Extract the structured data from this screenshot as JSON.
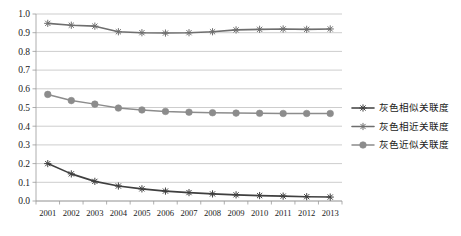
{
  "chart_data": {
    "type": "line",
    "title": "",
    "xlabel": "",
    "ylabel": "",
    "categories": [
      "2001",
      "2002",
      "2003",
      "2004",
      "2005",
      "2006",
      "2007",
      "2008",
      "2009",
      "2010",
      "2011",
      "2012",
      "2013"
    ],
    "ylim": [
      0.0,
      1.0
    ],
    "ytick_labels": [
      "0.0",
      "0.1",
      "0.2",
      "0.3",
      "0.4",
      "0.5",
      "0.6",
      "0.7",
      "0.8",
      "0.9",
      "1.0"
    ],
    "ytick_values": [
      0.0,
      0.1,
      0.2,
      0.3,
      0.4,
      0.5,
      0.6,
      0.7,
      0.8,
      0.9,
      1.0
    ],
    "grid": "horizontal",
    "legend_position": "right",
    "series": [
      {
        "name": "灰色相似关联度",
        "marker": "star",
        "color": "#3f3f3f",
        "values": [
          0.2,
          0.145,
          0.105,
          0.08,
          0.065,
          0.053,
          0.045,
          0.038,
          0.033,
          0.029,
          0.026,
          0.023,
          0.021
        ]
      },
      {
        "name": "灰色相近关联度",
        "marker": "star",
        "color": "#6e6e6e",
        "values": [
          0.95,
          0.94,
          0.935,
          0.905,
          0.9,
          0.898,
          0.9,
          0.905,
          0.915,
          0.918,
          0.92,
          0.918,
          0.92
        ]
      },
      {
        "name": "灰色近似关联度",
        "marker": "circle",
        "color": "#8c8c8c",
        "values": [
          0.57,
          0.537,
          0.518,
          0.497,
          0.487,
          0.479,
          0.475,
          0.472,
          0.47,
          0.469,
          0.468,
          0.468,
          0.468
        ]
      }
    ]
  },
  "legend": {
    "items": [
      {
        "label": "灰色相似关联度",
        "color": "#3f3f3f",
        "marker": "star"
      },
      {
        "label": "灰色相近关联度",
        "color": "#6e6e6e",
        "marker": "star"
      },
      {
        "label": "灰色近似关联度",
        "color": "#8c8c8c",
        "marker": "circle"
      }
    ]
  },
  "colors": {
    "background": "#ffffff",
    "grid": "#b7b7b7",
    "axis": "#9a9a9a",
    "text": "#1a1a1a"
  }
}
